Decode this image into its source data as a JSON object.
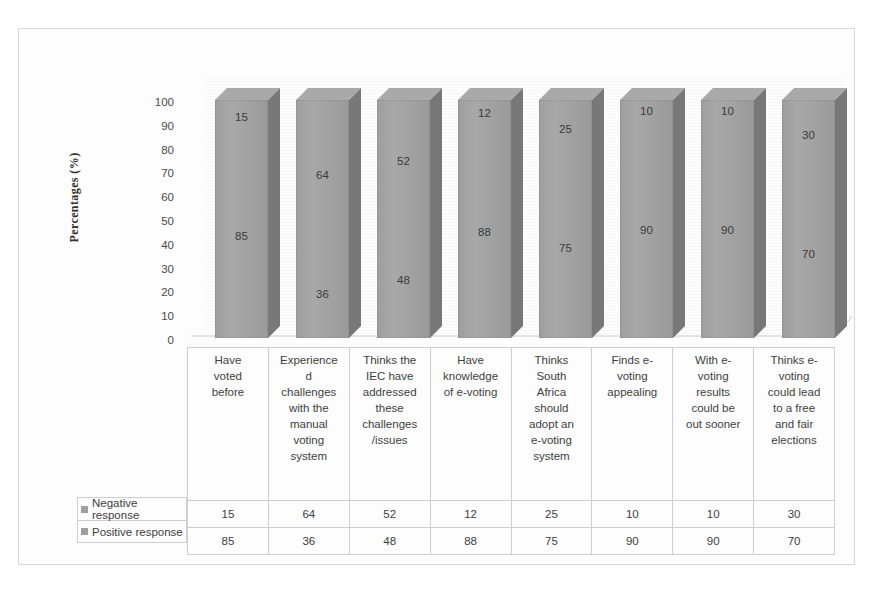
{
  "chart_data": {
    "type": "bar",
    "subtype": "3d-stacked-column",
    "title": "",
    "xlabel": "",
    "ylabel": "Percentages (%)",
    "ylim": [
      0,
      100
    ],
    "ytick_labels": [
      "100",
      "90",
      "80",
      "70",
      "60",
      "50",
      "40",
      "30",
      "20",
      "10",
      "0"
    ],
    "grid": false,
    "legend_position": "left-of-table",
    "categories": [
      "Have voted before",
      "Experienced challenges with the manual voting system",
      "Thinks the IEC have addressed these challenges /issues",
      "Have knowledge of e-voting",
      "Thinks South Africa should adopt an e-voting system",
      "Finds e-voting appealing",
      "With e-voting results could be out sooner",
      "Thinks e-voting could lead to a free and fair elections"
    ],
    "category_lines": [
      [
        "Have",
        "voted",
        "before"
      ],
      [
        "Experience",
        "d",
        "challenges",
        "with the",
        "manual",
        "voting",
        "system"
      ],
      [
        "Thinks the",
        "IEC have",
        "addressed",
        "these",
        "challenges",
        "/issues"
      ],
      [
        "Have",
        "knowledge",
        "of e-voting"
      ],
      [
        "Thinks",
        "South",
        "Africa",
        "should",
        "adopt an",
        "e-voting",
        "system"
      ],
      [
        "Finds e-",
        "voting",
        "appealing"
      ],
      [
        "With e-",
        "voting",
        "results",
        "could be",
        "out sooner"
      ],
      [
        "Thinks e-",
        "voting",
        "could lead",
        "to a free",
        "and fair",
        "elections"
      ]
    ],
    "series": [
      {
        "name": "Negative response",
        "values": [
          15,
          64,
          52,
          12,
          25,
          10,
          10,
          30
        ],
        "color": "#a6a6a6"
      },
      {
        "name": "Positive response",
        "values": [
          85,
          36,
          48,
          88,
          75,
          90,
          90,
          70
        ],
        "color": "#9a9a9a"
      }
    ]
  },
  "colors": {
    "bar_front": "#a2a2a2",
    "bar_top": "#a9a9a9",
    "bar_side": "#787878",
    "frame": "#d8d8d8",
    "table_border": "#cfcfcf",
    "legend_swatch": "#9e9e9e",
    "text": "#3d3d3d"
  }
}
